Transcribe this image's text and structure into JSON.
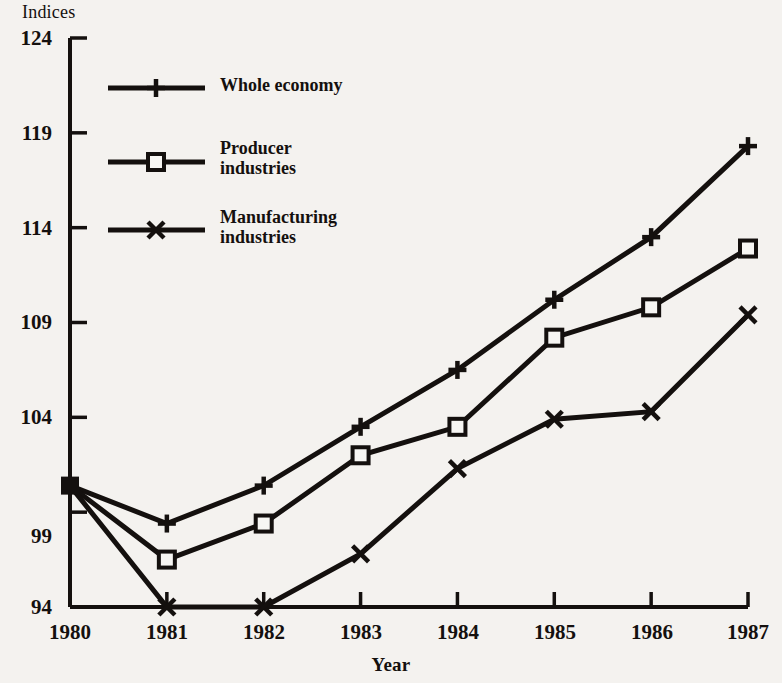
{
  "chart_data": {
    "type": "line",
    "title": "",
    "xlabel": "Year",
    "ylabel": "Indices",
    "categories": [
      1980,
      1981,
      1982,
      1983,
      1984,
      1985,
      1986,
      1987
    ],
    "xtick_labels": [
      "1980",
      "1981",
      "1982",
      "1983",
      "1984",
      "1985",
      "1986",
      "1987"
    ],
    "ytick_labels": [
      "94",
      "99",
      "104",
      "109",
      "114",
      "119",
      "124"
    ],
    "ytick_values": [
      94,
      99,
      104,
      109,
      114,
      119,
      124
    ],
    "ylim": [
      94,
      124
    ],
    "xlim": [
      1980,
      1987
    ],
    "grid": false,
    "legend_position": "upper-left-inside",
    "series": [
      {
        "name": "Whole economy",
        "marker": "plus",
        "values": [
          100.4,
          98.4,
          100.4,
          103.5,
          106.5,
          110.2,
          113.5,
          118.3
        ]
      },
      {
        "name": "Producer industries",
        "marker": "square",
        "values": [
          100.4,
          96.5,
          98.4,
          102.0,
          103.5,
          108.2,
          109.8,
          112.9
        ]
      },
      {
        "name": "Manufacturing industries",
        "marker": "ex",
        "values": [
          100.4,
          94.0,
          94.0,
          96.8,
          101.3,
          103.9,
          104.3,
          109.4
        ]
      }
    ]
  },
  "legend": {
    "entries": [
      {
        "label": "Whole economy",
        "marker": "plus"
      },
      {
        "label": "Producer\nindustries",
        "marker": "square"
      },
      {
        "label": "Manufacturing\nindustries",
        "marker": "ex"
      }
    ]
  },
  "colors": {
    "ink": "#14100e",
    "paper": "#f4f2ef"
  }
}
